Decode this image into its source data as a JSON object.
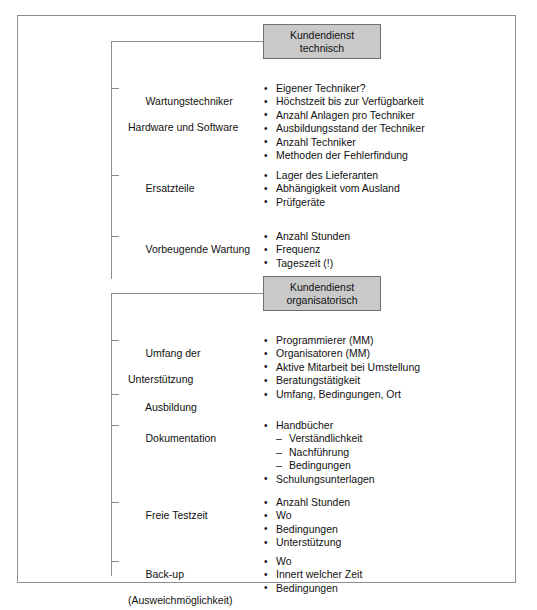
{
  "diagram": {
    "title_group_1": "Kundendienst technisch",
    "title_group_2": "Kundendienst organisatorisch",
    "colors": {
      "box_fill": "#c9c9c9",
      "box_border": "#6f6f6f",
      "frame_border": "#8d8d8d",
      "text": "#111111"
    },
    "groups": [
      {
        "header_line1": "Kundendienst",
        "header_line2": "technisch",
        "rows": [
          {
            "label_line1": "Wartungstechniker",
            "label_line2": "Hardware und Software",
            "bullets": [
              "Eigener Techniker?",
              "Höchstzeit bis zur Verfügbarkeit",
              "Anzahl Anlagen pro Techniker",
              "Ausbildungsstand der Techniker",
              "Anzahl Techniker",
              "Methoden der Fehlerfindung"
            ]
          },
          {
            "label_line1": "Ersatzteile",
            "label_line2": "",
            "bullets": [
              "Lager des Lieferanten",
              "Abhängigkeit vom Ausland",
              "Prüfgeräte"
            ]
          },
          {
            "label_line1": "Vorbeugende Wartung",
            "label_line2": "",
            "bullets": [
              "Anzahl Stunden",
              "Frequenz",
              "Tageszeit (!)"
            ]
          }
        ]
      },
      {
        "header_line1": "Kundendienst",
        "header_line2": "organisatorisch",
        "rows": [
          {
            "label_line1": "Umfang der",
            "label_line2": "Unterstützung",
            "bullets": [
              "Programmierer (MM)",
              "Organisatoren (MM)",
              "Aktive Mitarbeit bei Umstellung",
              "Beratungstätigkeit"
            ]
          },
          {
            "label_line1": "Ausbildung",
            "label_line2": "",
            "bullets": [
              "Umfang, Bedingungen, Ort"
            ]
          },
          {
            "label_line1": "Dokumentation",
            "label_line2": "",
            "bullets": [
              "Handbücher"
            ],
            "subitems": [
              "Verständlichkeit",
              "Nachführung",
              "Bedingungen"
            ],
            "bullets_after": [
              "Schulungsunterlagen"
            ]
          },
          {
            "label_line1": "Freie Testzeit",
            "label_line2": "",
            "bullets": [
              "Anzahl Stunden",
              "Wo",
              "Bedingungen",
              "Unterstützung"
            ]
          },
          {
            "label_line1": "Back-up",
            "label_line2": "(Ausweichmöglichkeit)",
            "bullets": [
              "Wo",
              "Innert welcher Zeit",
              "Bedingungen"
            ]
          }
        ]
      }
    ]
  }
}
